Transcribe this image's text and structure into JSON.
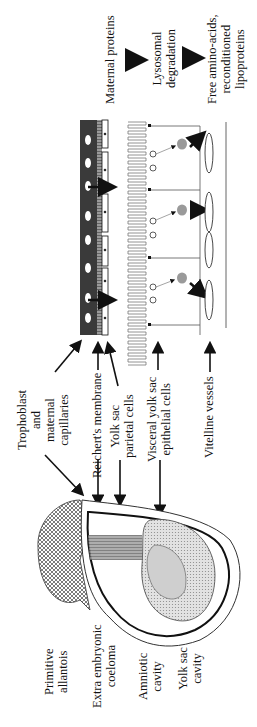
{
  "diagram": {
    "type": "embryo-yolk-sac-schematic",
    "orientation": "rotated-90-ccw",
    "pathway": {
      "steps": [
        "Maternal proteins",
        "Lysosomal degradation",
        "Free amino-acids, reconditioned lipoproteins"
      ]
    },
    "labels": {
      "maternal_proteins": "Maternal proteins",
      "lysosomal_1": "Lysosomal",
      "lysosomal_2": "degradation",
      "free_1": "Free amino-acids,",
      "free_2": "reconditioned",
      "free_3": "lipoproteins",
      "tropho_1": "Trophoblast",
      "tropho_2": "and",
      "tropho_3": "maternal",
      "tropho_4": "capillaries",
      "reichert": "Reichert's membrane",
      "parietal_1": "Yolk sac",
      "parietal_2": "parietal cells",
      "visceral_1": "Visceral yolk sac",
      "visceral_2": "epithelial cells",
      "vitelline": "Vitelline vessels",
      "allantois_1": "Primitive",
      "allantois_2": "allantois",
      "coeloma_1": "Extra embryonic",
      "coeloma_2": "coeloma",
      "amniotic_1": "Amniotic",
      "amniotic_2": "cavity",
      "yolk_1": "Yolk sac",
      "yolk_2": "cavity"
    },
    "colors": {
      "ink": "#111111",
      "trophoblast": "#3a3a3a",
      "stipple": "#c8c8c8",
      "vesicle": "#9a9a9a"
    }
  }
}
